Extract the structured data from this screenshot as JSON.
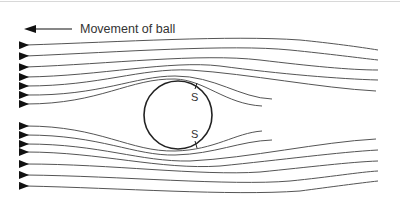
{
  "legend": {
    "label": "Movement of ball",
    "direction": "left"
  },
  "ball": {
    "cx": 178,
    "cy": 115,
    "r": 34,
    "separation_points": [
      {
        "label": "S",
        "position": "top"
      },
      {
        "label": "S",
        "position": "bottom"
      }
    ]
  },
  "flow": {
    "direction": "right",
    "streamline_count": 16
  },
  "colors": {
    "line": "#555555",
    "ball": "#222222",
    "text": "#333333"
  }
}
